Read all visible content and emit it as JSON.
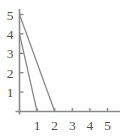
{
  "chart_data": {
    "type": "line",
    "title": "",
    "subtitle": "",
    "xlabel": "",
    "ylabel": "",
    "xlim": [
      0,
      5.5
    ],
    "ylim": [
      0,
      5.5
    ],
    "xticks": [
      1,
      2,
      3,
      4,
      5
    ],
    "yticks": [
      1,
      2,
      3,
      4,
      5
    ],
    "xtick_labels": [
      "1",
      "2",
      "3",
      "4",
      "5"
    ],
    "ytick_labels": [
      "1",
      "2",
      "3",
      "4",
      "5"
    ],
    "grid": false,
    "legend": false,
    "legend_position": "none",
    "annotations": [],
    "line_color": "#8a8a8a",
    "axis_color": "#8a8a8a",
    "label_color": "#4d4d4d",
    "series": [
      {
        "name": "line-shallow",
        "x": [
          0,
          2
        ],
        "values": [
          5,
          0
        ],
        "intercept_y": 5,
        "intercept_x": 2
      },
      {
        "name": "line-steep",
        "x": [
          0,
          1
        ],
        "values": [
          4,
          0
        ],
        "intercept_y": 4,
        "intercept_x": 1
      }
    ]
  },
  "axes": {
    "x_axis_name": "x-axis",
    "y_axis_name": "y-axis"
  }
}
